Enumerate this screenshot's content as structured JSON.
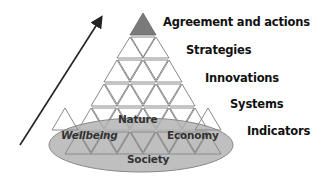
{
  "diagram": {
    "levels": [
      {
        "label": "Agreement and actions"
      },
      {
        "label": "Strategies"
      },
      {
        "label": "Innovations"
      },
      {
        "label": "Systems"
      },
      {
        "label": "Indicators"
      }
    ],
    "dimensions": {
      "top": "Nature",
      "left": "Wellbeing",
      "right": "Economy",
      "bottom": "Society"
    },
    "colors": {
      "apex_fill": "#7a7a7a",
      "ellipse_fill": "#b4b4b4",
      "triangle_stroke": "#8a8a8a",
      "arrow": "#222222"
    }
  }
}
